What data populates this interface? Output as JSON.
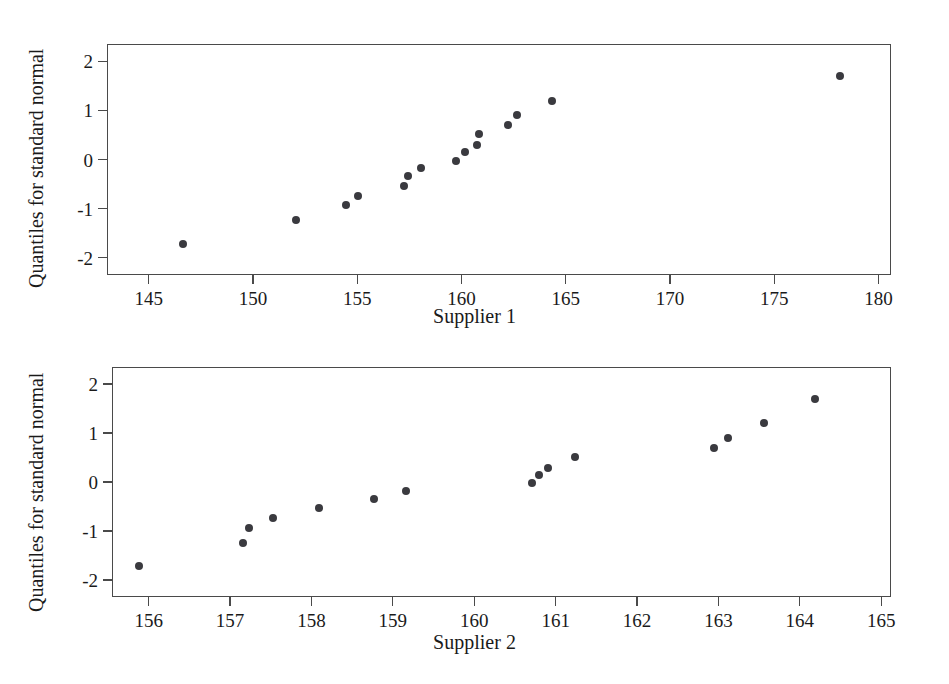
{
  "chart_data": [
    {
      "type": "scatter",
      "title": "",
      "xlabel": "Supplier 1",
      "ylabel": "Quantiles for standard normal",
      "xlim": [
        143.0,
        180.6
      ],
      "ylim": [
        -2.35,
        2.35
      ],
      "xticks": [
        145,
        150,
        155,
        160,
        165,
        170,
        175,
        180
      ],
      "yticks": [
        2,
        1,
        0,
        -1,
        -2
      ],
      "xticklabels": [
        "145",
        "150",
        "155",
        "160",
        "165",
        "170",
        "175",
        "180"
      ],
      "yticklabels": [
        "2",
        "1",
        "0",
        "-1",
        "-2"
      ],
      "grid": false,
      "legend": null,
      "marker_color": "#3a3a3f",
      "x": [
        146.6,
        152.0,
        154.4,
        155.0,
        157.2,
        157.4,
        158.0,
        159.7,
        160.1,
        160.7,
        160.8,
        162.2,
        162.6,
        164.3,
        178.1
      ],
      "y": [
        -1.7,
        -1.22,
        -0.91,
        -0.72,
        -0.52,
        -0.32,
        -0.16,
        0.0,
        0.17,
        0.31,
        0.53,
        0.72,
        0.92,
        1.22,
        1.72
      ]
    },
    {
      "type": "scatter",
      "title": "",
      "xlabel": "Supplier 2",
      "ylabel": "Quantiles for standard normal",
      "xlim": [
        155.55,
        165.12
      ],
      "ylim": [
        -2.35,
        2.35
      ],
      "xticks": [
        156,
        157,
        158,
        159,
        160,
        161,
        162,
        163,
        164,
        165
      ],
      "yticks": [
        2,
        1,
        0,
        -1,
        -2
      ],
      "xticklabels": [
        "156",
        "157",
        "158",
        "159",
        "160",
        "161",
        "162",
        "163",
        "164",
        "165"
      ],
      "yticklabels": [
        "2",
        "1",
        "0",
        "-1",
        "-2"
      ],
      "grid": false,
      "legend": null,
      "marker_color": "#3a3a3f",
      "x": [
        155.87,
        157.15,
        157.22,
        157.52,
        158.08,
        158.76,
        159.15,
        160.7,
        160.78,
        160.9,
        161.22,
        162.93,
        163.1,
        163.55,
        164.17
      ],
      "y": [
        -1.7,
        -1.22,
        -0.91,
        -0.72,
        -0.52,
        -0.32,
        -0.16,
        0.0,
        0.17,
        0.31,
        0.53,
        0.72,
        0.92,
        1.22,
        1.72
      ]
    }
  ]
}
